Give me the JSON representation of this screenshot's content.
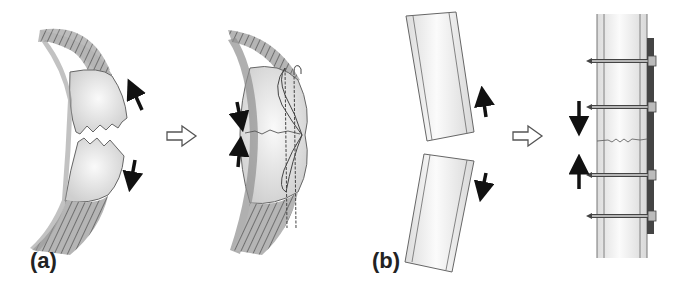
{
  "figure": {
    "panels": [
      {
        "label": "(a)",
        "subject": "patella-transverse-fracture",
        "before": "displaced-fragments",
        "after": "tension-band-wiring-fixation",
        "force_arrows_before": [
          "up",
          "down"
        ],
        "force_arrows_after": [
          "down",
          "up"
        ]
      },
      {
        "label": "(b)",
        "subject": "long-bone-transverse-fracture",
        "before": "displaced-fragments",
        "after": "plate-and-screw-fixation",
        "screw_count": 4,
        "force_arrows_before": [
          "up",
          "down"
        ],
        "force_arrows_after": [
          "down",
          "up"
        ]
      }
    ],
    "transition_icon": "hollow-right-arrow"
  },
  "colors": {
    "background": "#ffffff",
    "outline": "#555555",
    "bone_fill": "#e8e8e8",
    "tendon": "#8a8a8a",
    "arrow": "#111111",
    "plate": "#444444",
    "label": "#222222"
  }
}
